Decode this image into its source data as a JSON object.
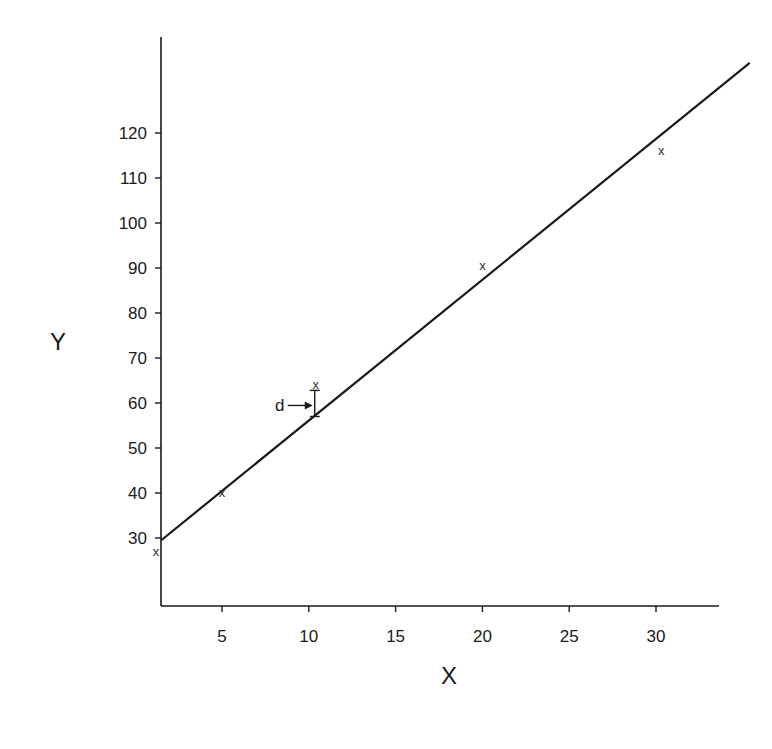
{
  "chart_data": {
    "type": "scatter",
    "title": "",
    "xlabel": "X",
    "ylabel": "Y",
    "xlim": [
      1.5,
      34.2
    ],
    "ylim": [
      15.5,
      136
    ],
    "grid": false,
    "legend": null,
    "x_ticks": [
      5,
      10,
      15,
      20,
      25,
      30
    ],
    "y_ticks": [
      30,
      40,
      50,
      60,
      70,
      80,
      90,
      100,
      110,
      120
    ],
    "points": [
      {
        "x": 1.2,
        "y": 27,
        "marker": "x"
      },
      {
        "x": 5,
        "y": 40,
        "marker": "x"
      },
      {
        "x": 10.4,
        "y": 64,
        "marker": "x"
      },
      {
        "x": 20,
        "y": 90.5,
        "marker": "x"
      },
      {
        "x": 30.3,
        "y": 116,
        "marker": "x"
      }
    ],
    "fit_line": {
      "x_start": 1.5,
      "y_start": 29.5,
      "x_end": 35.4,
      "y_end": 135.6,
      "slope": 3.13,
      "intercept": 24.8
    },
    "annotations": [
      {
        "text": "d",
        "description": "arrow pointing to vertical deviation between point at x=10.4 and regression line",
        "x": 10.4,
        "y_top": 62.8,
        "y_bottom": 57
      }
    ]
  },
  "labels": {
    "x_axis": "X",
    "y_axis": "Y",
    "deviation": "d",
    "marker_glyph": "x"
  }
}
